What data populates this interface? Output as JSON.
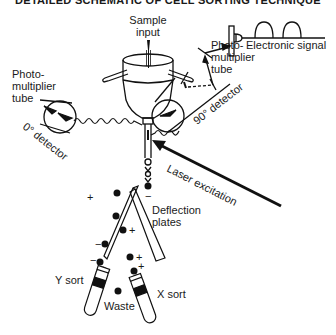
{
  "title": "DETAILED SCHEMATIC OF CELL SORTING TECHNIQUE",
  "labels": {
    "sample_input": [
      "Sample",
      "input"
    ],
    "pmt_left": [
      "Photo-",
      "multiplier",
      "tube"
    ],
    "pmt_right": [
      "Photo-",
      "multiplier",
      "tube"
    ],
    "detector_0": "0° detector",
    "detector_90": "90° detector",
    "electronic_signal": "Electronic signal",
    "laser": "Laser excitation",
    "deflection": [
      "Deflection",
      "plates"
    ],
    "y_sort": "Y sort",
    "x_sort": "X sort",
    "waste": "Waste"
  },
  "charges": {
    "left_plate": "+",
    "right_plate": "−",
    "drop_plus_1": "+",
    "drop_minus_1": "−",
    "drop_plus_2": "+",
    "drop_minus_2": "−",
    "drop_plus_3": "+"
  },
  "colors": {
    "ink": "#111111",
    "background": "#ffffff"
  }
}
